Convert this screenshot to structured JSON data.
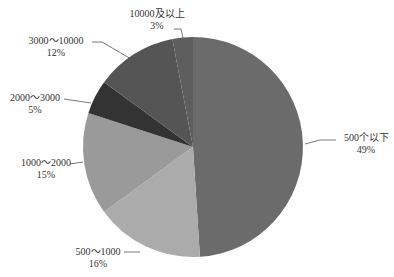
{
  "chart_data": {
    "type": "pie",
    "title": "",
    "start_angle_deg": 0,
    "direction": "clockwise",
    "center": [
      193,
      147
    ],
    "radius": 110,
    "categories": [
      "500个以下",
      "500～1000",
      "1000～2000",
      "2000～3000",
      "3000～10000",
      "10000及以上"
    ],
    "values": [
      49,
      16,
      15,
      5,
      12,
      3
    ],
    "value_labels": [
      "49%",
      "16%",
      "15%",
      "5%",
      "12%",
      "3%"
    ],
    "colors": [
      "#6b6b6b",
      "#ababab",
      "#9a9a9a",
      "#333333",
      "#555555",
      "#5e5e5e"
    ],
    "labels": [
      {
        "name": "500个以下",
        "pct": "49%",
        "x": 344,
        "y": 141,
        "anchor": "start",
        "line": [
          [
            305,
            144
          ],
          [
            320,
            140
          ],
          [
            336,
            140
          ]
        ]
      },
      {
        "name": "500～1000",
        "pct": "16%",
        "x": 98,
        "y": 255,
        "anchor": "middle",
        "line": [
          [
            140,
            252
          ],
          [
            124,
            252
          ]
        ]
      },
      {
        "name": "1000～2000",
        "pct": "15%",
        "x": 46,
        "y": 166,
        "anchor": "middle",
        "line": [
          [
            83,
            162
          ],
          [
            70,
            164
          ]
        ]
      },
      {
        "name": "2000～3000",
        "pct": "5%",
        "x": 35,
        "y": 101,
        "anchor": "middle",
        "line": [
          [
            91,
            103
          ],
          [
            64,
            99
          ]
        ]
      },
      {
        "name": "3000～10000",
        "pct": "12%",
        "x": 56,
        "y": 44,
        "anchor": "middle",
        "line": [
          [
            131,
            59
          ],
          [
            102,
            42
          ],
          [
            92,
            42
          ]
        ]
      },
      {
        "name": "10000及以上",
        "pct": "3%",
        "x": 157,
        "y": 17,
        "anchor": "middle",
        "line": [
          [
            183,
            38
          ],
          [
            181,
            29
          ],
          [
            174,
            29
          ]
        ]
      }
    ],
    "legend": null,
    "grid": false
  }
}
